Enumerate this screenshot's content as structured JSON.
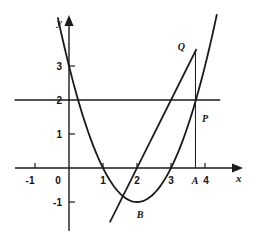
{
  "figure": {
    "title": "",
    "background_color": "#ffffff",
    "stroke_color": "#1a1a1a"
  },
  "axes": {
    "x_axis_label": "x",
    "y_axis_label": "y",
    "x_ticks": [
      {
        "value": -1,
        "label": "-1"
      },
      {
        "value": 0,
        "label": "0"
      },
      {
        "value": 1,
        "label": "1"
      },
      {
        "value": 2,
        "label": "2"
      },
      {
        "value": 3,
        "label": "3"
      },
      {
        "value": 4,
        "label": "4"
      }
    ],
    "y_ticks": [
      {
        "value": -1,
        "label": "-1"
      },
      {
        "value": 1,
        "label": "1"
      },
      {
        "value": 2,
        "label": "2"
      },
      {
        "value": 3,
        "label": "3"
      }
    ]
  },
  "point_labels": {
    "A": "A",
    "B": "B",
    "P": "P",
    "Q": "Q"
  },
  "chart_data": {
    "type": "line",
    "title": "",
    "xlabel": "x",
    "ylabel": "y",
    "xlim": [
      -1.6,
      4.6
    ],
    "ylim": [
      -1.7,
      4.1
    ],
    "grid": false,
    "legend": "none",
    "xticks": [
      -1,
      0,
      1,
      2,
      3,
      4
    ],
    "xticklabels": [
      "-1",
      "0",
      "1",
      "2",
      "3",
      "4"
    ],
    "yticks": [
      -1,
      1,
      2,
      3
    ],
    "yticklabels": [
      "-1",
      "1",
      "2",
      "3"
    ],
    "series": [
      {
        "name": "parabola",
        "equation": "y = x^2 - 4x + 3",
        "kind": "quadratic",
        "a": 1,
        "b": -4,
        "c": 3,
        "roots": [
          1,
          3
        ],
        "vertex": [
          2,
          -1
        ],
        "y_intercept": 3,
        "x_domain": [
          -0.33,
          4.35
        ]
      },
      {
        "name": "straight-line",
        "equation": "y = 2x - 4",
        "kind": "linear",
        "slope": 2,
        "intercept": -4,
        "x_domain": [
          1.2,
          3.75
        ]
      },
      {
        "name": "horizontal-line",
        "equation": "y = 2",
        "kind": "horizontal",
        "y_value": 2,
        "x_domain": [
          -1.6,
          4.45
        ]
      },
      {
        "name": "vertical-segment-AQ",
        "equation": "x = 3.72",
        "kind": "vertical",
        "x_value": 3.72,
        "y_domain": [
          0,
          3.45
        ]
      }
    ],
    "annotations": [
      {
        "label": "A",
        "x": 3.72,
        "y": 0,
        "role": "foot-of-vertical-on-x-axis"
      },
      {
        "label": "B",
        "x": 2.05,
        "y": -1.3,
        "role": "parabola-vertex"
      },
      {
        "label": "P",
        "x": 3.88,
        "y": 1.45,
        "role": "point-on-parabola"
      },
      {
        "label": "Q",
        "x": 3.5,
        "y": 3.48,
        "role": "point-on-line"
      }
    ]
  }
}
